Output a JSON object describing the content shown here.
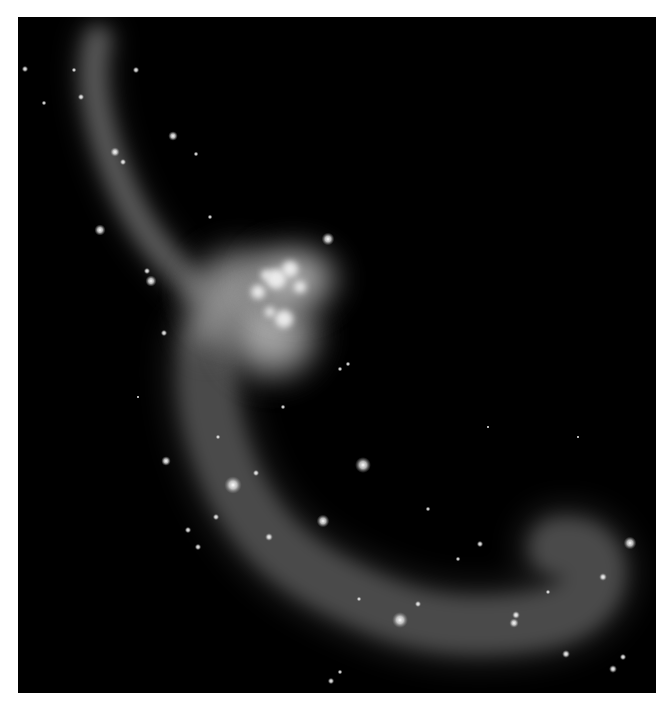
{
  "image": {
    "subject": "Interacting galaxy pair with long tidal tails (grayscale astronomical image)",
    "background_color": "#000000",
    "page_color": "#ffffff",
    "frame": {
      "x": 18,
      "y": 17,
      "width": 638,
      "height": 676
    }
  },
  "scene": {
    "upper_tail": {
      "path": "M 80 22 C 70 60, 80 110, 100 160 C 118 205, 140 235, 175 268",
      "width": 26,
      "opacity": 0.42
    },
    "lower_tail": {
      "path": "M 190 330 C 185 380, 195 420, 215 465 C 240 515, 270 545, 320 570 C 370 595, 410 610, 470 608 C 520 606, 560 600, 575 570 C 585 545, 570 525, 540 530",
      "width": 58,
      "opacity": 0.34
    },
    "galaxy_glows": [
      {
        "cx": 222,
        "cy": 275,
        "rx": 60,
        "ry": 55,
        "opacity": 0.75
      },
      {
        "cx": 255,
        "cy": 318,
        "rx": 58,
        "ry": 55,
        "opacity": 0.8
      },
      {
        "cx": 275,
        "cy": 262,
        "rx": 55,
        "ry": 42,
        "opacity": 0.85
      },
      {
        "cx": 190,
        "cy": 300,
        "rx": 30,
        "ry": 45,
        "opacity": 0.45
      }
    ],
    "bright_knots": [
      {
        "cx": 258,
        "cy": 262,
        "r": 10
      },
      {
        "cx": 272,
        "cy": 252,
        "r": 8
      },
      {
        "cx": 240,
        "cy": 275,
        "r": 7
      },
      {
        "cx": 282,
        "cy": 270,
        "r": 6
      },
      {
        "cx": 266,
        "cy": 302,
        "r": 9
      },
      {
        "cx": 252,
        "cy": 295,
        "r": 5
      },
      {
        "cx": 248,
        "cy": 258,
        "r": 5
      }
    ],
    "stars": [
      {
        "x": 82,
        "y": 213,
        "r": 3.5
      },
      {
        "x": 118,
        "y": 53,
        "r": 2
      },
      {
        "x": 97,
        "y": 135,
        "r": 3
      },
      {
        "x": 155,
        "y": 119,
        "r": 3
      },
      {
        "x": 133,
        "y": 264,
        "r": 3.5
      },
      {
        "x": 129,
        "y": 254,
        "r": 2
      },
      {
        "x": 310,
        "y": 222,
        "r": 4
      },
      {
        "x": 345,
        "y": 448,
        "r": 5
      },
      {
        "x": 215,
        "y": 468,
        "r": 5.5
      },
      {
        "x": 305,
        "y": 504,
        "r": 4
      },
      {
        "x": 382,
        "y": 603,
        "r": 5
      },
      {
        "x": 612,
        "y": 526,
        "r": 4
      },
      {
        "x": 400,
        "y": 587,
        "r": 2
      },
      {
        "x": 496,
        "y": 606,
        "r": 3
      },
      {
        "x": 498,
        "y": 598,
        "r": 2.5
      },
      {
        "x": 548,
        "y": 637,
        "r": 2.5
      },
      {
        "x": 585,
        "y": 560,
        "r": 2.5
      },
      {
        "x": 595,
        "y": 652,
        "r": 2.5
      },
      {
        "x": 148,
        "y": 444,
        "r": 3
      },
      {
        "x": 251,
        "y": 520,
        "r": 2.5
      },
      {
        "x": 238,
        "y": 456,
        "r": 2
      },
      {
        "x": 198,
        "y": 500,
        "r": 2
      },
      {
        "x": 170,
        "y": 513,
        "r": 2
      },
      {
        "x": 180,
        "y": 530,
        "r": 2
      },
      {
        "x": 462,
        "y": 527,
        "r": 2
      },
      {
        "x": 341,
        "y": 582,
        "r": 1.5
      },
      {
        "x": 358,
        "y": 688,
        "r": 2
      },
      {
        "x": 313,
        "y": 664,
        "r": 2
      },
      {
        "x": 322,
        "y": 655,
        "r": 1.5
      },
      {
        "x": 605,
        "y": 640,
        "r": 2
      },
      {
        "x": 146,
        "y": 316,
        "r": 2
      },
      {
        "x": 63,
        "y": 80,
        "r": 2
      },
      {
        "x": 56,
        "y": 53,
        "r": 1.5
      },
      {
        "x": 105,
        "y": 145,
        "r": 2
      },
      {
        "x": 178,
        "y": 137,
        "r": 1.5
      },
      {
        "x": 192,
        "y": 200,
        "r": 1.5
      },
      {
        "x": 7,
        "y": 52,
        "r": 2
      },
      {
        "x": 26,
        "y": 86,
        "r": 1.5
      },
      {
        "x": 330,
        "y": 347,
        "r": 1.5
      },
      {
        "x": 322,
        "y": 352,
        "r": 1.5
      },
      {
        "x": 410,
        "y": 492,
        "r": 1.5
      },
      {
        "x": 470,
        "y": 410,
        "r": 1
      },
      {
        "x": 560,
        "y": 420,
        "r": 1
      },
      {
        "x": 265,
        "y": 390,
        "r": 1.5
      },
      {
        "x": 200,
        "y": 420,
        "r": 1.5
      },
      {
        "x": 440,
        "y": 542,
        "r": 1.5
      },
      {
        "x": 530,
        "y": 575,
        "r": 1.5
      },
      {
        "x": 120,
        "y": 380,
        "r": 1
      }
    ]
  }
}
